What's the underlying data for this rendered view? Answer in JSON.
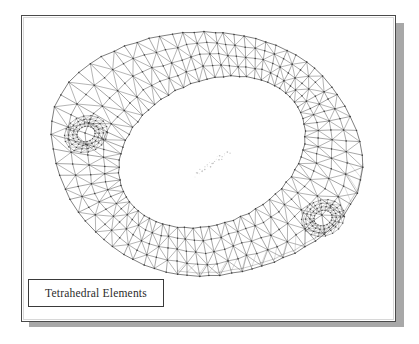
{
  "figure": {
    "caption_label": "Tetrahedral Elements",
    "background_color": "#ffffff",
    "frame_border_color": "#4a4a4a",
    "shadow_color": "#a8a8a8",
    "mesh_line_color": "#555555",
    "mesh_node_color": "#333333",
    "caption_border_color": "#3a3a3a",
    "caption_text_color": "#2b2b2b"
  },
  "chart_data": {
    "type": "mesh",
    "title": "Tetrahedral Elements",
    "projection": "isometric-3d-wireframe",
    "outer_boundary": {
      "shape": "rounded-oblong",
      "points": [
        [
          52,
          118
        ],
        [
          62,
          92
        ],
        [
          84,
          68
        ],
        [
          116,
          50
        ],
        [
          156,
          37
        ],
        [
          200,
          32
        ],
        [
          244,
          36
        ],
        [
          282,
          48
        ],
        [
          312,
          66
        ],
        [
          334,
          90
        ],
        [
          352,
          120
        ],
        [
          362,
          152
        ],
        [
          360,
          184
        ],
        [
          346,
          212
        ],
        [
          322,
          236
        ],
        [
          288,
          256
        ],
        [
          248,
          270
        ],
        [
          206,
          276
        ],
        [
          166,
          272
        ],
        [
          130,
          258
        ],
        [
          100,
          236
        ],
        [
          74,
          206
        ],
        [
          58,
          170
        ],
        [
          52,
          140
        ]
      ]
    },
    "inner_opening": {
      "shape": "ellipse",
      "center": [
        212,
        152
      ],
      "radius_x": 97,
      "radius_y": 71,
      "rotation_deg": -24
    },
    "bolt_holes": [
      {
        "name": "upper-left-bolt-hole",
        "center": [
          86,
          134
        ],
        "radius_x": 22,
        "radius_y": 18,
        "rotation_deg": -20
      },
      {
        "name": "lower-right-bolt-hole",
        "center": [
          323,
          218
        ],
        "radius_x": 22,
        "radius_y": 18,
        "rotation_deg": -20
      }
    ],
    "mesh_stats": {
      "element_type": "tetrahedral",
      "surface_face_type": "triangle",
      "radial_divisions": 4,
      "circumferential_divisions": 72
    },
    "center_artifact": {
      "name": "scan-speckle",
      "from": [
        195,
        175
      ],
      "to": [
        228,
        152
      ]
    }
  }
}
